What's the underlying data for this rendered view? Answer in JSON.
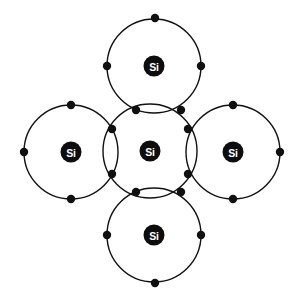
{
  "diagram": {
    "type": "atomic-bonding-diagram",
    "canvas": {
      "width": 298,
      "height": 302,
      "background": "#ffffff"
    },
    "style": {
      "shell_stroke_color": "#111111",
      "shell_stroke_width": 1.4,
      "electron_color": "#101010",
      "electron_radius": 4.2,
      "nucleus_fill": "#0d0d0d",
      "nucleus_radius": 10.5,
      "nucleus_text_color": "#ffffff"
    },
    "atoms": [
      {
        "id": "center",
        "label": "Si",
        "cx": 150,
        "cy": 151,
        "shell_radius": 47,
        "role": "central-atom"
      },
      {
        "id": "top",
        "label": "Si",
        "cx": 154,
        "cy": 66,
        "shell_radius": 47,
        "role": "neighbor-atom"
      },
      {
        "id": "bottom",
        "label": "Si",
        "cx": 154,
        "cy": 235,
        "shell_radius": 47,
        "role": "neighbor-atom"
      },
      {
        "id": "left",
        "label": "Si",
        "cx": 71,
        "cy": 152,
        "shell_radius": 47,
        "role": "neighbor-atom"
      },
      {
        "id": "right",
        "label": "Si",
        "cx": 233,
        "cy": 152,
        "shell_radius": 47,
        "role": "neighbor-atom"
      }
    ],
    "lone_electrons": [
      {
        "atom": "top",
        "cx": 155,
        "cy": 18,
        "position": "outer-top"
      },
      {
        "atom": "top",
        "cx": 107,
        "cy": 66,
        "position": "outer-left"
      },
      {
        "atom": "top",
        "cx": 201,
        "cy": 66,
        "position": "outer-right"
      },
      {
        "atom": "bottom",
        "cx": 155,
        "cy": 283,
        "position": "outer-bottom"
      },
      {
        "atom": "bottom",
        "cx": 107,
        "cy": 235,
        "position": "outer-left"
      },
      {
        "atom": "bottom",
        "cx": 201,
        "cy": 235,
        "position": "outer-right"
      },
      {
        "atom": "left",
        "cx": 24,
        "cy": 152,
        "position": "outer-left"
      },
      {
        "atom": "left",
        "cx": 71,
        "cy": 105,
        "position": "outer-top"
      },
      {
        "atom": "left",
        "cx": 71,
        "cy": 199,
        "position": "outer-bottom"
      },
      {
        "atom": "right",
        "cx": 280,
        "cy": 152,
        "position": "outer-right"
      },
      {
        "atom": "right",
        "cx": 233,
        "cy": 105,
        "position": "outer-top"
      },
      {
        "atom": "right",
        "cx": 233,
        "cy": 199,
        "position": "outer-bottom"
      }
    ],
    "bond_pairs": [
      {
        "bond": "center-top",
        "electrons": [
          {
            "cx": 136,
            "cy": 110
          },
          {
            "cx": 181,
            "cy": 110
          }
        ]
      },
      {
        "bond": "center-bottom",
        "electrons": [
          {
            "cx": 136,
            "cy": 192
          },
          {
            "cx": 181,
            "cy": 192
          }
        ]
      },
      {
        "bond": "center-left",
        "electrons": [
          {
            "cx": 112,
            "cy": 129
          },
          {
            "cx": 112,
            "cy": 174
          }
        ]
      },
      {
        "bond": "center-right",
        "electrons": [
          {
            "cx": 188,
            "cy": 129
          },
          {
            "cx": 188,
            "cy": 174
          }
        ]
      }
    ],
    "legend": {
      "element_symbol": "Si",
      "element_name": "Silicon",
      "valence_electrons": 4,
      "bond_count": 4
    }
  }
}
